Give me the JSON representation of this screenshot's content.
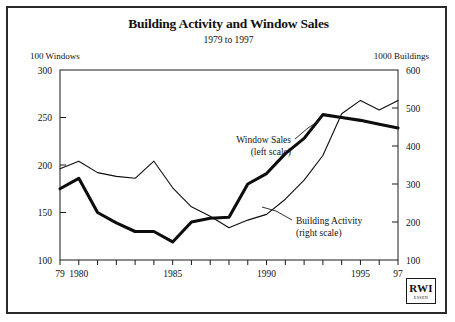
{
  "chart_data": {
    "type": "line",
    "title": "Building Activity and Window Sales",
    "subtitle": "1979 to 1997",
    "ylabel_left": "100 Windows",
    "ylabel_right": "1000 Buildings",
    "xlabel": "",
    "grid": false,
    "legend_position": "inline-annotations",
    "x": [
      1979,
      1980,
      1981,
      1982,
      1983,
      1984,
      1985,
      1986,
      1987,
      1988,
      1989,
      1990,
      1991,
      1992,
      1993,
      1994,
      1995,
      1996,
      1997
    ],
    "xtick_labels": [
      "79",
      "1980",
      "1985",
      "1990",
      "1995",
      "97"
    ],
    "xtick_values": [
      1979,
      1980,
      1985,
      1990,
      1995,
      1997
    ],
    "xlim": [
      1979,
      1997
    ],
    "ylim_left": [
      100,
      300
    ],
    "ytick_left": [
      100,
      150,
      200,
      250,
      300
    ],
    "ylim_right": [
      100,
      600
    ],
    "ytick_right": [
      100,
      200,
      300,
      400,
      500,
      600
    ],
    "series": [
      {
        "name": "Window Sales",
        "axis": "left",
        "style": "thick",
        "annotation": "Window Sales",
        "annotation_sub": "(left scale)",
        "values": [
          175,
          186,
          150,
          139,
          130,
          130,
          119,
          140,
          144,
          145,
          180,
          191,
          212,
          228,
          253,
          250,
          247,
          243,
          239
        ]
      },
      {
        "name": "Building Activity",
        "axis": "right",
        "style": "thin",
        "annotation": "Building Activity",
        "annotation_sub": "(right scale)",
        "values": [
          340,
          360,
          330,
          320,
          315,
          360,
          290,
          240,
          215,
          185,
          205,
          220,
          260,
          310,
          375,
          485,
          520,
          495,
          520
        ]
      }
    ]
  },
  "logo": {
    "mark": "RWI",
    "sub": "ESSEN"
  }
}
